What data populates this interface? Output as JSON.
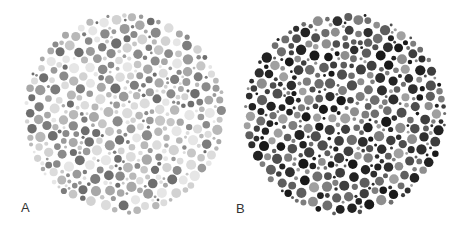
{
  "plates": [
    {
      "id": "A",
      "label": "A",
      "description": "light-toned dot plate",
      "background": "#ffffff",
      "tones": [
        "#e6e6e6",
        "#dcdcdc",
        "#d2d2d2",
        "#c6c6c6",
        "#b8b8b8",
        "#a8a8a8",
        "#9a9a9a",
        "#8a8a8a",
        "#7c7c7c",
        "#6e6e6e"
      ],
      "seed": 7
    },
    {
      "id": "B",
      "label": "B",
      "description": "dark-toned dot plate",
      "background": "#ffffff",
      "tones": [
        "#a0a0a0",
        "#8e8e8e",
        "#7e7e7e",
        "#6e6e6e",
        "#5e5e5e",
        "#4e4e4e",
        "#3e3e3e",
        "#2e2e2e",
        "#222222",
        "#191919"
      ],
      "seed": 19
    }
  ]
}
